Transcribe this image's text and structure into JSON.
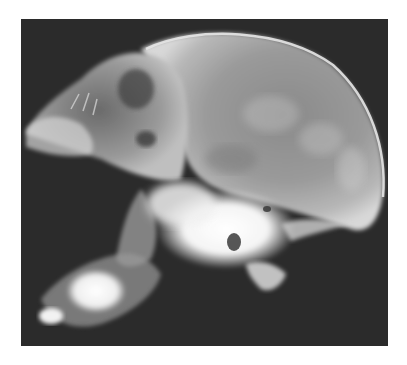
{
  "image": {
    "kind": "radiograph",
    "subject": "lateral skull x-ray",
    "background_color": "#ffffff",
    "panel_color": "#2b2b2b"
  }
}
